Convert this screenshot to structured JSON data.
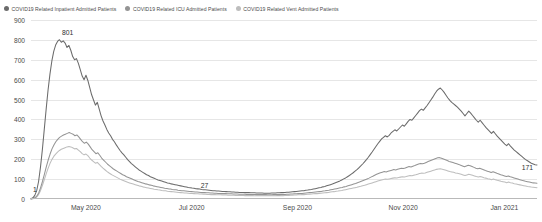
{
  "legend": {
    "position": "top-left",
    "items": [
      {
        "label": "COVID19 Related Inpatient Admitted Patients",
        "color": "#6b6b6b",
        "marker": "circle-icon"
      },
      {
        "label": "COVID19 Related ICU Admitted Patients",
        "color": "#949494",
        "marker": "circle-icon"
      },
      {
        "label": "COVID19 Related Vent Admitted Patients",
        "color": "#bdbdbd",
        "marker": "circle-icon"
      }
    ]
  },
  "chart_data": {
    "type": "line",
    "title": "",
    "subtitle": "",
    "xlabel": "",
    "ylabel": "",
    "ylim": [
      0,
      900
    ],
    "ytick_labels": [
      "0",
      "100",
      "200",
      "300",
      "400",
      "500",
      "600",
      "700",
      "800",
      "900"
    ],
    "ytick_values": [
      0,
      100,
      200,
      300,
      400,
      500,
      600,
      700,
      800,
      900
    ],
    "xtick_labels": [
      "May 2020",
      "Jul 2020",
      "Sep 2020",
      "Nov 2020",
      "Jan 2021"
    ],
    "xtick_positions": [
      0.1085,
      0.3175,
      0.5265,
      0.7355,
      0.9355
    ],
    "grid": true,
    "legend_position": "top-left",
    "x_range_start": "2020-03-20",
    "x_range_end": "2021-02-10",
    "annotations": [
      {
        "text": "1",
        "x_frac": 0.0075,
        "value": 1,
        "series": "COVID19 Related Inpatient Admitted Patients"
      },
      {
        "text": "801",
        "x_frac": 0.0725,
        "value": 801,
        "series": "COVID19 Related Inpatient Admitted Patients"
      },
      {
        "text": "27",
        "x_frac": 0.343,
        "value": 27,
        "series": "COVID19 Related Inpatient Admitted Patients"
      },
      {
        "text": "171",
        "x_frac": 0.981,
        "value": 171,
        "series": "COVID19 Related Inpatient Admitted Patients"
      }
    ],
    "series": [
      {
        "name": "COVID19 Related Inpatient Admitted Patients",
        "color": "#6b6b6b",
        "values": [
          1,
          6,
          18,
          42,
          88,
          160,
          248,
          350,
          452,
          548,
          628,
          694,
          742,
          774,
          792,
          801,
          788,
          795,
          784,
          762,
          772,
          748,
          716,
          700,
          706,
          682,
          650,
          618,
          600,
          622,
          596,
          560,
          524,
          498,
          472,
          486,
          452,
          418,
          392,
          372,
          350,
          332,
          318,
          300,
          288,
          272,
          258,
          244,
          232,
          222,
          210,
          198,
          188,
          178,
          170,
          162,
          154,
          146,
          140,
          134,
          128,
          122,
          118,
          112,
          108,
          104,
          100,
          96,
          93,
          90,
          87,
          84,
          81,
          79,
          76,
          74,
          72,
          70,
          68,
          66,
          64,
          62,
          60,
          58,
          57,
          55,
          54,
          52,
          51,
          50,
          48,
          47,
          46,
          45,
          44,
          43,
          42,
          41,
          40,
          40,
          39,
          38,
          38,
          37,
          36,
          36,
          35,
          35,
          34,
          34,
          33,
          33,
          33,
          32,
          32,
          32,
          31,
          31,
          31,
          30,
          30,
          30,
          30,
          29,
          29,
          29,
          29,
          30,
          30,
          30,
          31,
          31,
          32,
          32,
          33,
          34,
          34,
          35,
          36,
          37,
          38,
          39,
          40,
          41,
          42,
          44,
          45,
          47,
          48,
          50,
          52,
          54,
          56,
          58,
          61,
          63,
          66,
          69,
          72,
          75,
          79,
          83,
          87,
          91,
          96,
          101,
          106,
          112,
          118,
          125,
          132,
          140,
          148,
          157,
          166,
          176,
          187,
          198,
          210,
          223,
          236,
          250,
          264,
          278,
          290,
          302,
          310,
          318,
          312,
          320,
          332,
          340,
          348,
          342,
          352,
          362,
          372,
          366,
          378,
          390,
          400,
          396,
          408,
          420,
          432,
          444,
          452,
          446,
          458,
          470,
          484,
          498,
          512,
          528,
          542,
          552,
          558,
          548,
          536,
          522,
          508,
          496,
          486,
          478,
          470,
          462,
          452,
          442,
          430,
          418,
          430,
          442,
          432,
          420,
          408,
          396,
          386,
          396,
          384,
          372,
          360,
          350,
          340,
          330,
          340,
          328,
          316,
          306,
          296,
          286,
          276,
          268,
          278,
          266,
          256,
          246,
          238,
          230,
          222,
          214,
          206,
          198,
          192,
          186,
          180,
          176,
          172,
          171
        ]
      },
      {
        "name": "COVID19 Related ICU Admitted Patients",
        "color": "#949494",
        "values": [
          0,
          2,
          6,
          14,
          30,
          56,
          88,
          124,
          162,
          196,
          226,
          252,
          272,
          288,
          300,
          310,
          316,
          322,
          326,
          330,
          334,
          330,
          326,
          318,
          322,
          312,
          300,
          288,
          280,
          286,
          276,
          262,
          248,
          238,
          228,
          232,
          220,
          206,
          196,
          186,
          176,
          168,
          160,
          152,
          146,
          140,
          134,
          128,
          122,
          118,
          112,
          108,
          104,
          100,
          96,
          92,
          88,
          85,
          82,
          79,
          76,
          74,
          71,
          69,
          66,
          64,
          62,
          60,
          58,
          56,
          54,
          53,
          51,
          50,
          48,
          47,
          46,
          44,
          43,
          42,
          41,
          40,
          39,
          38,
          37,
          36,
          35,
          35,
          34,
          33,
          32,
          32,
          31,
          31,
          30,
          30,
          29,
          29,
          28,
          28,
          27,
          27,
          27,
          26,
          26,
          26,
          25,
          25,
          25,
          24,
          24,
          24,
          24,
          23,
          23,
          23,
          23,
          23,
          22,
          22,
          22,
          22,
          22,
          22,
          21,
          21,
          21,
          22,
          22,
          22,
          22,
          23,
          23,
          23,
          24,
          24,
          25,
          25,
          26,
          26,
          27,
          28,
          28,
          29,
          30,
          31,
          32,
          33,
          34,
          35,
          36,
          37,
          38,
          40,
          41,
          43,
          44,
          46,
          48,
          50,
          52,
          54,
          56,
          58,
          61,
          63,
          66,
          69,
          72,
          75,
          78,
          82,
          85,
          89,
          93,
          97,
          101,
          105,
          110,
          114,
          119,
          124,
          128,
          132,
          135,
          138,
          136,
          139,
          142,
          145,
          148,
          146,
          149,
          152,
          155,
          153,
          156,
          160,
          163,
          161,
          165,
          168,
          172,
          176,
          179,
          177,
          180,
          184,
          188,
          192,
          196,
          200,
          204,
          207,
          208,
          205,
          201,
          197,
          193,
          189,
          186,
          183,
          180,
          177,
          174,
          170,
          166,
          162,
          166,
          170,
          167,
          163,
          159,
          155,
          152,
          155,
          151,
          147,
          143,
          140,
          137,
          133,
          137,
          133,
          129,
          126,
          122,
          119,
          116,
          113,
          116,
          112,
          109,
          106,
          103,
          100,
          97,
          94,
          92,
          89,
          87,
          85,
          83,
          81,
          80,
          79
        ]
      },
      {
        "name": "COVID19 Related Vent Admitted Patients",
        "color": "#bdbdbd",
        "values": [
          0,
          1,
          4,
          10,
          22,
          42,
          68,
          96,
          126,
          154,
          178,
          198,
          214,
          226,
          236,
          244,
          250,
          254,
          258,
          262,
          264,
          262,
          258,
          252,
          254,
          246,
          238,
          228,
          222,
          226,
          218,
          206,
          196,
          188,
          180,
          184,
          174,
          164,
          155,
          147,
          139,
          132,
          126,
          120,
          115,
          110,
          105,
          100,
          96,
          92,
          88,
          84,
          81,
          78,
          75,
          72,
          69,
          66,
          64,
          61,
          59,
          57,
          55,
          53,
          51,
          49,
          48,
          46,
          45,
          43,
          42,
          41,
          39,
          38,
          37,
          36,
          35,
          34,
          33,
          32,
          31,
          30,
          30,
          29,
          28,
          28,
          27,
          26,
          26,
          25,
          25,
          24,
          24,
          23,
          23,
          22,
          22,
          22,
          21,
          21,
          21,
          20,
          20,
          20,
          19,
          19,
          19,
          19,
          18,
          18,
          18,
          18,
          18,
          17,
          17,
          17,
          17,
          17,
          16,
          16,
          16,
          16,
          16,
          16,
          16,
          16,
          16,
          16,
          16,
          16,
          17,
          17,
          17,
          17,
          18,
          18,
          18,
          19,
          19,
          20,
          20,
          21,
          21,
          22,
          22,
          23,
          24,
          24,
          25,
          26,
          27,
          27,
          28,
          29,
          30,
          31,
          32,
          33,
          35,
          36,
          37,
          39,
          40,
          42,
          43,
          45,
          47,
          49,
          51,
          53,
          55,
          57,
          59,
          62,
          64,
          67,
          69,
          72,
          75,
          78,
          81,
          84,
          87,
          90,
          93,
          96,
          98,
          100,
          99,
          101,
          103,
          105,
          107,
          106,
          108,
          110,
          112,
          111,
          113,
          116,
          118,
          117,
          120,
          122,
          125,
          128,
          130,
          129,
          131,
          134,
          137,
          140,
          143,
          146,
          149,
          151,
          152,
          150,
          147,
          144,
          141,
          138,
          136,
          134,
          131,
          129,
          127,
          124,
          121,
          118,
          121,
          124,
          122,
          119,
          116,
          113,
          111,
          113,
          110,
          107,
          105,
          102,
          100,
          97,
          100,
          97,
          94,
          92,
          89,
          87,
          85,
          82,
          85,
          82,
          80,
          77,
          75,
          73,
          71,
          69,
          67,
          65,
          63,
          62,
          60,
          59,
          58,
          57
        ]
      }
    ]
  }
}
